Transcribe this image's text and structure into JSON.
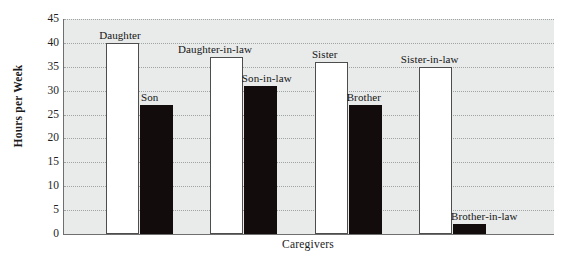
{
  "chart_data": {
    "type": "bar",
    "title": "",
    "xlabel": "Caregivers",
    "ylabel": "Hours per Week",
    "ylim": [
      0,
      45
    ],
    "yticks": [
      45,
      40,
      35,
      30,
      25,
      20,
      15,
      10,
      5,
      0
    ],
    "grid": true,
    "legend": "none",
    "categories": [
      "Daughter",
      "Son",
      "Daughter-in-law",
      "Son-in-law",
      "Sister",
      "Brother",
      "Sister-in-law",
      "Brother-in-law"
    ],
    "values": [
      40,
      27,
      37,
      31,
      36,
      27,
      35,
      2
    ],
    "bars": [
      {
        "label": "Daughter",
        "value": 40,
        "fill": "white",
        "x_pct": 8.6,
        "width_pct": 6.7,
        "label_offset_x": -7,
        "label_above": 13
      },
      {
        "label": "Son",
        "value": 27,
        "fill": "black",
        "x_pct": 15.5,
        "width_pct": 6.7,
        "label_offset_x": 1,
        "label_above": 13
      },
      {
        "label": "Daughter-in-law",
        "value": 37,
        "fill": "white",
        "x_pct": 29.8,
        "width_pct": 6.7,
        "label_offset_x": -32,
        "label_above": 13
      },
      {
        "label": "Son-in-law",
        "value": 31,
        "fill": "black",
        "x_pct": 36.7,
        "width_pct": 6.7,
        "label_offset_x": -2,
        "label_above": 13
      },
      {
        "label": "Sister",
        "value": 36,
        "fill": "white",
        "x_pct": 51.2,
        "width_pct": 6.7,
        "label_offset_x": -3,
        "label_above": 13
      },
      {
        "label": "Brother",
        "value": 27,
        "fill": "black",
        "x_pct": 58.1,
        "width_pct": 6.7,
        "label_offset_x": -2,
        "label_above": 13
      },
      {
        "label": "Sister-in-law",
        "value": 35,
        "fill": "white",
        "x_pct": 72.4,
        "width_pct": 6.7,
        "label_offset_x": -18,
        "label_above": 13
      },
      {
        "label": "Brother-in-law",
        "value": 2,
        "fill": "black",
        "x_pct": 79.4,
        "width_pct": 6.7,
        "label_offset_x": -2,
        "label_above": 13
      }
    ],
    "colors": {
      "plot_background": "#e9ebea",
      "bar_white_fill": "#ffffff",
      "bar_white_border": "#4d4d4d",
      "bar_black_fill": "#120d0c",
      "gridline": "#9aa0a0",
      "axis": "#6f6f6f",
      "text": "#1b1b1b",
      "page_background": "#ffffff"
    }
  }
}
